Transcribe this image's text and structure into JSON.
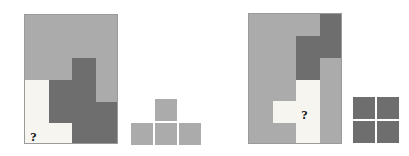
{
  "canvas": {
    "width": 409,
    "height": 156,
    "background": "#ffffff"
  },
  "palette": {
    "light_gray": "#ababab",
    "dark_gray": "#6e6e6e",
    "cream": "#f6f5f0",
    "border": "#9a9a9a",
    "question_mark_color": "#111111"
  },
  "question_mark": "?",
  "puzzles": [
    {
      "name": "left-puzzle",
      "frame": {
        "x": 24,
        "y": 14,
        "width": 94,
        "height": 130
      },
      "grid": {
        "cols": 4,
        "rows": 6
      },
      "cells": [
        [
          "light_gray",
          "light_gray",
          "light_gray",
          "light_gray"
        ],
        [
          "light_gray",
          "light_gray",
          "light_gray",
          "light_gray"
        ],
        [
          "light_gray",
          "light_gray",
          "dark_gray",
          "light_gray"
        ],
        [
          "cream",
          "dark_gray",
          "dark_gray",
          "light_gray"
        ],
        [
          "cream",
          "dark_gray",
          "dark_gray",
          "dark_gray"
        ],
        [
          "cream",
          "cream",
          "dark_gray",
          "dark_gray"
        ]
      ],
      "question_cell": {
        "col": 0,
        "row": 5
      },
      "options": {
        "name": "left-option-shape",
        "shape": "t-tetromino",
        "color": "light_gray",
        "origin": {
          "x": 131,
          "y": 99
        },
        "cell_size": 22,
        "gap": 2,
        "blocks": [
          {
            "col": 1,
            "row": 0
          },
          {
            "col": 0,
            "row": 1
          },
          {
            "col": 1,
            "row": 1
          },
          {
            "col": 2,
            "row": 1
          }
        ]
      }
    },
    {
      "name": "right-puzzle",
      "frame": {
        "x": 248,
        "y": 13,
        "width": 94,
        "height": 131
      },
      "grid": {
        "cols": 4,
        "rows": 6
      },
      "cells": [
        [
          "light_gray",
          "light_gray",
          "light_gray",
          "dark_gray"
        ],
        [
          "light_gray",
          "light_gray",
          "dark_gray",
          "dark_gray"
        ],
        [
          "light_gray",
          "light_gray",
          "dark_gray",
          "light_gray"
        ],
        [
          "light_gray",
          "light_gray",
          "cream",
          "light_gray"
        ],
        [
          "light_gray",
          "cream",
          "cream",
          "light_gray"
        ],
        [
          "light_gray",
          "light_gray",
          "cream",
          "light_gray"
        ]
      ],
      "question_cell": {
        "col": 2,
        "row": 4
      },
      "options": {
        "name": "right-option-shape",
        "shape": "o-tetromino",
        "color": "dark_gray",
        "origin": {
          "x": 353,
          "y": 97
        },
        "cell_size": 22,
        "gap": 2,
        "blocks": [
          {
            "col": 0,
            "row": 0
          },
          {
            "col": 1,
            "row": 0
          },
          {
            "col": 0,
            "row": 1
          },
          {
            "col": 1,
            "row": 1
          }
        ]
      }
    }
  ]
}
